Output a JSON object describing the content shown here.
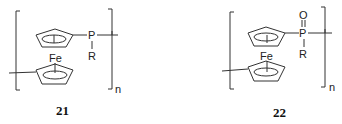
{
  "figure": {
    "structures": [
      {
        "id": "compound-21",
        "label": "21",
        "atoms": {
          "metal": "Fe",
          "phosphorus": "P",
          "substituent": "R"
        },
        "repeat_subscript": "n",
        "description": "Poly(ferrocenylphosphine): ferrocene 1,1'-linked through P(R) units"
      },
      {
        "id": "compound-22",
        "label": "22",
        "atoms": {
          "metal": "Fe",
          "phosphorus": "P",
          "oxygen": "O",
          "substituent": "R"
        },
        "repeat_subscript": "n",
        "description": "Poly(ferrocenylphosphine oxide): ferrocene 1,1'-linked through P(=O)R units"
      }
    ],
    "colors": {
      "line": "#333333",
      "background": "#ffffff"
    }
  }
}
